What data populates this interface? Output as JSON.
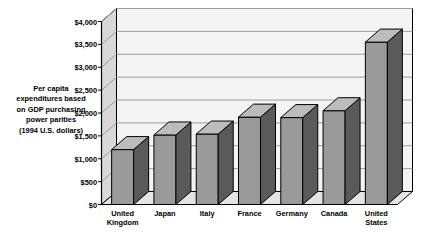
{
  "chart_data": {
    "type": "bar",
    "title": "",
    "subtitle": "",
    "xlabel": "",
    "ylabel": "Per capita expenditures based on GDP purchasing power parities (1994 U.S. dollars)",
    "ylabel_lines": [
      "Per capita",
      "expenditures based",
      "on GDP purchasing",
      "power parities",
      "(1994 U.S. dollars)"
    ],
    "categories": [
      "United Kingdom",
      "Japan",
      "Italy",
      "France",
      "Germany",
      "Canada",
      "United States"
    ],
    "category_lines": [
      [
        "United",
        "Kingdom"
      ],
      [
        "Japan"
      ],
      [
        "Italy"
      ],
      [
        "France"
      ],
      [
        "Germany"
      ],
      [
        "Canada"
      ],
      [
        "United",
        "States"
      ]
    ],
    "values": [
      1200,
      1520,
      1540,
      1910,
      1900,
      2050,
      3550
    ],
    "ylim": [
      0,
      4000
    ],
    "ytick_values": [
      0,
      500,
      1000,
      1500,
      2000,
      2500,
      3000,
      3500,
      4000
    ],
    "ytick_labels": [
      "$0",
      "$500",
      "$1,000",
      "$1,500",
      "$2,000",
      "$2,500",
      "$3,000",
      "$3,500",
      "$4,000"
    ],
    "grid": true,
    "grid_axis": "y",
    "legend": false,
    "legend_position": "none",
    "style": "3d-column",
    "colors": {
      "bar_front": "#9a9a9a",
      "bar_top": "#bcbcbc",
      "bar_side": "#5a5a5a",
      "bar_outline": "#000000",
      "plot_background": "#eeeeee",
      "back_wall": "#f4f4f4",
      "left_wall": "#d8d8d8",
      "floor": "#e4e4e4",
      "gridline": "#9b9b9b",
      "axis_line": "#000000",
      "page_background": "#ffffff",
      "text": "#000000"
    }
  }
}
